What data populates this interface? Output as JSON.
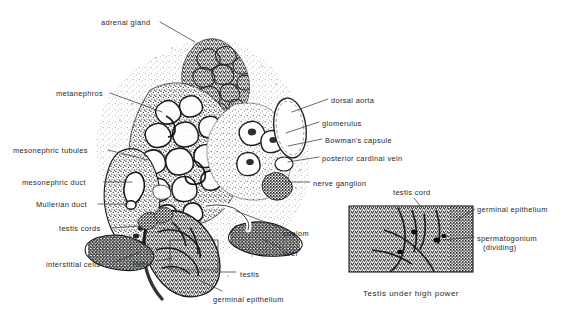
{
  "figure": {
    "background_color": "#ffffff",
    "ink_color": "#262626",
    "kind": "labeled histological drawing",
    "main_panel": {
      "name": "embryonic urogenital cross section",
      "labels": [
        {
          "id": "adrenal-gland",
          "text": "adrenal gland",
          "x": 101,
          "y": 18,
          "align": "left",
          "leader": [
            [
              160,
              22
            ],
            [
              195,
              42
            ]
          ]
        },
        {
          "id": "metanephros",
          "text": "metanephros",
          "x": 56,
          "y": 89,
          "align": "left",
          "leader": [
            [
              110,
              93
            ],
            [
              162,
              112
            ]
          ]
        },
        {
          "id": "mesonephric-tubules",
          "text": "mesonephric tubules",
          "x": 13,
          "y": 146,
          "align": "left",
          "leader": [
            [
              108,
              150
            ],
            [
              148,
              160
            ]
          ]
        },
        {
          "id": "mesonephric-duct",
          "text": "mesonephric duct",
          "x": 22,
          "y": 178,
          "align": "left",
          "leader": [
            [
              104,
              182
            ],
            [
              132,
              182
            ]
          ]
        },
        {
          "id": "mullerian-duct",
          "text": "Mullerian duct",
          "x": 36,
          "y": 200,
          "align": "left",
          "leader": [
            [
              98,
              204
            ],
            [
              128,
              204
            ]
          ]
        },
        {
          "id": "testis-cords",
          "text": "testis cords",
          "x": 59,
          "y": 224,
          "align": "left",
          "leader": [
            [
              112,
              228
            ],
            [
              140,
              226
            ]
          ]
        },
        {
          "id": "interstitial-cells",
          "text": "interstitial cells",
          "x": 46,
          "y": 260,
          "align": "left",
          "leader": [
            [
              115,
              262
            ],
            [
              140,
              252
            ]
          ]
        },
        {
          "id": "liver-left",
          "text": "liver",
          "x": 133,
          "y": 259,
          "align": "left",
          "leader": [
            [
              157,
              261
            ],
            [
              172,
              258
            ]
          ]
        },
        {
          "id": "testis",
          "text": "testis",
          "x": 240,
          "y": 270,
          "align": "left",
          "leader": [
            [
              215,
              272
            ],
            [
              236,
              272
            ]
          ]
        },
        {
          "id": "germinal-epithelium-main",
          "text": "germinal epithelium",
          "x": 213,
          "y": 295,
          "align": "left",
          "leader": [
            [
              201,
              281
            ],
            [
              222,
              291
            ]
          ]
        },
        {
          "id": "liver-right",
          "text": "liver",
          "x": 283,
          "y": 249,
          "align": "left",
          "leader": [
            [
              262,
              239
            ],
            [
              281,
              248
            ]
          ]
        },
        {
          "id": "coelom",
          "text": "coelom",
          "x": 283,
          "y": 229,
          "align": "left",
          "leader": [
            [
              236,
              211
            ],
            [
              281,
              228
            ]
          ]
        },
        {
          "id": "dorsal-aorta",
          "text": "dorsal aorta",
          "x": 331,
          "y": 96,
          "align": "left",
          "leader": [
            [
              292,
              112
            ],
            [
              328,
              99
            ]
          ]
        },
        {
          "id": "glomerulus",
          "text": "glomerulus",
          "x": 322,
          "y": 119,
          "align": "left",
          "leader": [
            [
              286,
              133
            ],
            [
              319,
              122
            ]
          ]
        },
        {
          "id": "bowmans-capsule",
          "text": "Bowman's capsule",
          "x": 325,
          "y": 136,
          "align": "left",
          "leader": [
            [
              288,
              146
            ],
            [
              322,
              139
            ]
          ]
        },
        {
          "id": "posterior-cardinal-vein",
          "text": "posterior cardinal vein",
          "x": 322,
          "y": 154,
          "align": "left",
          "leader": [
            [
              288,
              162
            ],
            [
              319,
              157
            ]
          ]
        },
        {
          "id": "nerve-ganglion",
          "text": "nerve ganglion",
          "x": 313,
          "y": 179,
          "align": "left",
          "leader": [
            [
              285,
              182
            ],
            [
              310,
              182
            ]
          ]
        }
      ]
    },
    "inset_panel": {
      "name": "testis under high power",
      "caption": "Testis under high power",
      "caption_x": 363,
      "caption_y": 289,
      "frame": {
        "x": 349,
        "y": 206,
        "width": 124,
        "height": 66
      },
      "labels": [
        {
          "id": "inset-testis-cord",
          "text": "testis cord",
          "x": 393,
          "y": 188,
          "align": "left",
          "leader": [
            [
              414,
              198
            ],
            [
              422,
              208
            ]
          ]
        },
        {
          "id": "inset-germinal-epithelium",
          "text": "germinal epithelium",
          "x": 477,
          "y": 205,
          "align": "left",
          "leader": [
            [
              455,
              221
            ],
            [
              475,
              209
            ]
          ]
        },
        {
          "id": "inset-spermatogonium",
          "text": "spermatogonium",
          "x": 477,
          "y": 234,
          "align": "left",
          "leader": [
            [
              443,
              240
            ],
            [
              474,
              237
            ]
          ]
        },
        {
          "id": "inset-spermatogonium-sub",
          "text": "(dividing)",
          "x": 483,
          "y": 243,
          "align": "left",
          "leader": null
        }
      ]
    }
  }
}
